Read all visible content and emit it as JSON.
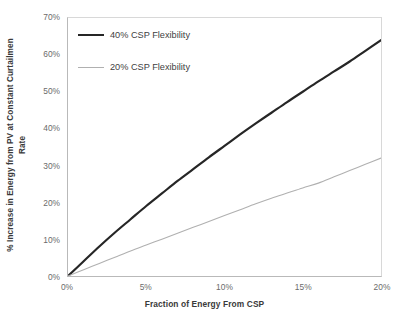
{
  "chart_data": {
    "type": "line",
    "title": "",
    "xlabel": "Fraction of Energy From CSP",
    "ylabel": "% Increase in Energy from PV at Constant Curtailmen Rate",
    "ylabel_line1": "% Increase in Energy from PV at Constant Curtailmen",
    "ylabel_line2": "Rate",
    "xlim": [
      0,
      20
    ],
    "ylim": [
      0,
      70
    ],
    "x_tick_labels": [
      "0%",
      "5%",
      "10%",
      "15%",
      "20%"
    ],
    "x_tick_values": [
      0,
      5,
      10,
      15,
      20
    ],
    "y_tick_labels": [
      "0%",
      "10%",
      "20%",
      "30%",
      "40%",
      "50%",
      "60%",
      "70%"
    ],
    "y_tick_values": [
      0,
      10,
      20,
      30,
      40,
      50,
      60,
      70
    ],
    "grid": false,
    "legend_position": "upper-left-inside",
    "x": [
      0,
      1,
      2,
      3,
      4,
      5,
      6,
      7,
      8,
      9,
      10,
      11,
      12,
      13,
      14,
      15,
      16,
      17,
      18,
      19,
      20
    ],
    "series": [
      {
        "name": "40% CSP Flexibility",
        "color": "#262626",
        "width": 2.2,
        "values": [
          0,
          4.0,
          8.0,
          11.8,
          15.4,
          19.0,
          22.4,
          25.8,
          29.0,
          32.2,
          35.3,
          38.4,
          41.4,
          44.3,
          47.2,
          50.0,
          52.8,
          55.5,
          58.2,
          61.1,
          64.0
        ]
      },
      {
        "name": "20% CSP Flexibility",
        "color": "#b0b0b0",
        "width": 1.1,
        "values": [
          0,
          1.7,
          3.4,
          5.1,
          6.8,
          8.4,
          10.0,
          11.6,
          13.2,
          14.8,
          16.4,
          18.0,
          19.6,
          21.1,
          22.5,
          23.9,
          25.2,
          26.9,
          28.6,
          30.3,
          32.0
        ]
      }
    ]
  },
  "legend": {
    "entries": [
      {
        "label": "40% CSP Flexibility"
      },
      {
        "label": "20% CSP Flexibility"
      }
    ]
  }
}
